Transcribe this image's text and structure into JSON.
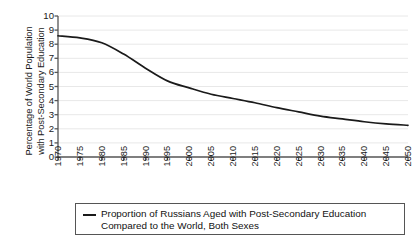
{
  "chart_data": {
    "type": "line",
    "title": "",
    "xlabel": "",
    "ylabel": "Percentage of World Population with Post-Secondary Education",
    "ylabel_lines": [
      "Percentage of World Population",
      "with Post-Secondary Education"
    ],
    "x": [
      1970,
      1975,
      1980,
      1985,
      1990,
      1995,
      2000,
      2005,
      2010,
      2015,
      2020,
      2025,
      2030,
      2035,
      2040,
      2045,
      2050
    ],
    "categories": [
      "1970",
      "1975",
      "1980",
      "1985",
      "1990",
      "1995",
      "2000",
      "2005",
      "2010",
      "2015",
      "2020",
      "2025",
      "2030",
      "2035",
      "2040",
      "2045",
      "2050"
    ],
    "values": [
      8.6,
      8.45,
      8.1,
      7.3,
      6.3,
      5.4,
      4.9,
      4.45,
      4.15,
      3.85,
      3.5,
      3.2,
      2.9,
      2.7,
      2.5,
      2.35,
      2.25
    ],
    "series": [
      {
        "name": "Proportion of Russians Aged with Post-Secondary Education Compared to the World, Both Sexes",
        "values": [
          8.6,
          8.45,
          8.1,
          7.3,
          6.3,
          5.4,
          4.9,
          4.45,
          4.15,
          3.85,
          3.5,
          3.2,
          2.9,
          2.7,
          2.5,
          2.35,
          2.25
        ],
        "color": "#1a1a1a"
      }
    ],
    "ylim": [
      0,
      10
    ],
    "xlim": [
      1970,
      2050
    ],
    "yticks": [
      0,
      1,
      2,
      3,
      4,
      5,
      6,
      7,
      8,
      9,
      10
    ],
    "ytick_labels": [
      "0",
      "1",
      "2",
      "3",
      "4",
      "5",
      "6",
      "7",
      "8",
      "9",
      "10"
    ],
    "grid": "horizontal",
    "grid_color": "#e8e8e8",
    "axis_color": "#555555",
    "legend_position": "below",
    "legend": [
      {
        "label_lines": [
          "Proportion of Russians Aged with Post-Secondary Education",
          "Compared to the World, Both Sexes"
        ],
        "marker": "line",
        "color": "#1a1a1a"
      }
    ]
  },
  "colors": {
    "line": "#1a1a1a",
    "grid": "#e8e8e8",
    "axis": "#555555",
    "legend_border": "#555555",
    "background": "#ffffff",
    "text": "#1a1a1a"
  }
}
